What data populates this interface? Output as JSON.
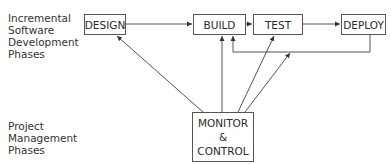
{
  "labels": {
    "software": [
      "Incremental",
      "Software",
      "Development",
      "Phases"
    ],
    "project": [
      "Project",
      "Management",
      "Phases"
    ]
  },
  "boxes": {
    "design": "DESIGN",
    "build": "BUILD",
    "test": "TEST",
    "deploy": "DEPLOY",
    "monitor": [
      "MONITOR",
      "&",
      "CONTROL"
    ]
  },
  "colors": {
    "line": "#555555",
    "text": "#2a2a2a",
    "background": "#ffffff"
  }
}
